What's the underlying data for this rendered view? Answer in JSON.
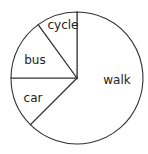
{
  "chart_data": {
    "type": "pie",
    "title": "",
    "categories": [
      "walk",
      "car",
      "bus",
      "cycle"
    ],
    "values": [
      25,
      5,
      6,
      4
    ],
    "angles_deg": [
      225,
      45,
      54,
      36
    ],
    "percentages": [
      62.5,
      12.5,
      15,
      10
    ],
    "start_angle_deg": 90,
    "direction": "clockwise-from-top for walk, remaining slices counter-clockwise ordered cycle, bus, car",
    "legend": "none (labels inside slices)",
    "fill_color": "#ffffff",
    "stroke_color": "#333333",
    "labels": [
      {
        "text": "walk",
        "x": 117,
        "y": 80
      },
      {
        "text": "car",
        "x": 33,
        "y": 98
      },
      {
        "text": "bus",
        "x": 35,
        "y": 60
      },
      {
        "text": "cycle",
        "x": 63,
        "y": 25
      }
    ]
  },
  "geometry": {
    "cx": 77,
    "cy": 78,
    "r": 66
  }
}
